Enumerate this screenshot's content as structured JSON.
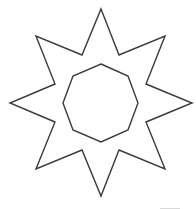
{
  "diagram": {
    "stroke_color": "#3a3a3a",
    "background": "#ffffff",
    "star": {
      "points": "101,9 119,55 165,36 146,84 192,103 146,122 165,169 119,150 101,196 82,150 36,169 55,122 10,103 55,84 36,36 82,55"
    },
    "octagon": {
      "points": "101,64 128,76 138,103 128,130 101,142 73,130 63,103 73,76"
    }
  }
}
